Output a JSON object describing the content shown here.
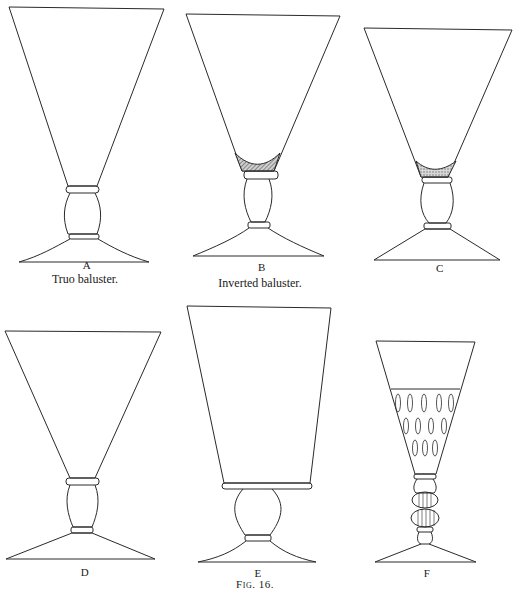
{
  "figure": {
    "caption": "Fig. 16.",
    "glasses": [
      {
        "letter": "A",
        "caption": "Truo baluster."
      },
      {
        "letter": "B",
        "caption": "Inverted baluster."
      },
      {
        "letter": "C",
        "caption": ""
      },
      {
        "letter": "D",
        "caption": ""
      },
      {
        "letter": "E",
        "caption": ""
      },
      {
        "letter": "F",
        "caption": ""
      }
    ]
  },
  "colors": {
    "ink": "#2a2a2a",
    "paper": "#ffffff",
    "shade": "#8a8a8a"
  }
}
